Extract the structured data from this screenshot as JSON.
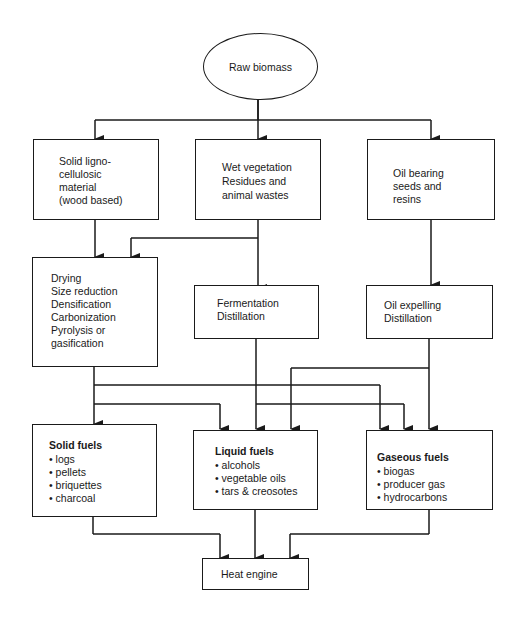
{
  "diagram": {
    "type": "flowchart",
    "root": {
      "label": "Raw biomass"
    },
    "sources": [
      {
        "id": "solid",
        "lines": [
          "Solid ligno-",
          "cellulosic",
          "material",
          "(wood based)"
        ]
      },
      {
        "id": "wet",
        "lines": [
          "Wet vegetation",
          "Residues and",
          "animal wastes"
        ]
      },
      {
        "id": "oil",
        "lines": [
          "Oil bearing",
          "seeds and",
          "resins"
        ]
      }
    ],
    "processes": [
      {
        "id": "thermo",
        "lines": [
          "Drying",
          "Size reduction",
          "Densification",
          "Carbonization",
          "Pyrolysis or",
          "gasification"
        ]
      },
      {
        "id": "ferment",
        "lines": [
          "Fermentation",
          "Distillation"
        ]
      },
      {
        "id": "expel",
        "lines": [
          "Oil expelling",
          "Distillation"
        ]
      }
    ],
    "fuels": [
      {
        "id": "solid_fuels",
        "title": "Solid fuels",
        "items": [
          "logs",
          "pellets",
          "briquettes",
          "charcoal"
        ]
      },
      {
        "id": "liquid_fuels",
        "title": "Liquid fuels",
        "items": [
          "alcohols",
          "vegetable oils",
          "tars & creosotes"
        ]
      },
      {
        "id": "gaseous_fuels",
        "title": "Gaseous fuels",
        "items": [
          "biogas",
          "producer gas",
          "hydrocarbons"
        ]
      }
    ],
    "sink": {
      "label": "Heat engine"
    },
    "edges": [
      [
        "Raw biomass",
        "Solid ligno-cellulosic material"
      ],
      [
        "Raw biomass",
        "Wet vegetation"
      ],
      [
        "Raw biomass",
        "Oil bearing seeds and resins"
      ],
      [
        "Solid ligno-cellulosic material",
        "Drying/Size reduction/..."
      ],
      [
        "Wet vegetation",
        "Drying/Size reduction/..."
      ],
      [
        "Wet vegetation",
        "Fermentation/Distillation"
      ],
      [
        "Oil bearing seeds and resins",
        "Oil expelling/Distillation"
      ],
      [
        "Drying/Size reduction/...",
        "Solid fuels"
      ],
      [
        "Drying/Size reduction/...",
        "Liquid fuels"
      ],
      [
        "Drying/Size reduction/...",
        "Gaseous fuels"
      ],
      [
        "Fermentation/Distillation",
        "Liquid fuels"
      ],
      [
        "Fermentation/Distillation",
        "Gaseous fuels"
      ],
      [
        "Oil expelling/Distillation",
        "Liquid fuels"
      ],
      [
        "Oil expelling/Distillation",
        "Gaseous fuels"
      ],
      [
        "Solid fuels",
        "Heat engine"
      ],
      [
        "Liquid fuels",
        "Heat engine"
      ],
      [
        "Gaseous fuels",
        "Heat engine"
      ]
    ]
  }
}
